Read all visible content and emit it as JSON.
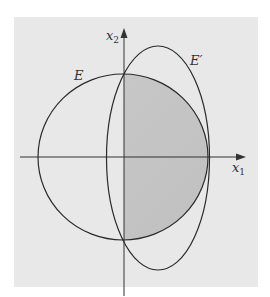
{
  "figure": {
    "labels": {
      "x_axis": "x",
      "x_axis_sub": "1",
      "y_axis": "x",
      "y_axis_sub": "2",
      "set_E": "E",
      "set_E_prime": "E′"
    },
    "colors": {
      "background": "#e8e8e8",
      "shaded": "#c4c4c4",
      "stroke": "#2a2a2a"
    }
  }
}
